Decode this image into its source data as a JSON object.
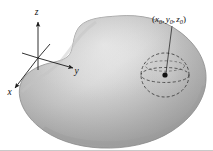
{
  "figure": {
    "caption_text": "",
    "background_color": "#ffffff",
    "axes": {
      "name": "coordinate-axes",
      "origin": {
        "x": 38,
        "y": 58
      },
      "labels": [
        {
          "id": "z",
          "text": "z",
          "x": 36.5,
          "y": 14.5,
          "axis": "z-axis",
          "direction": "up"
        },
        {
          "id": "y",
          "text": "y",
          "x": 76.5,
          "y": 73.5,
          "axis": "y-axis",
          "direction": "right"
        },
        {
          "id": "x",
          "text": "x",
          "x": 9.5,
          "y": 94.5,
          "axis": "x-axis",
          "direction": "lower-left"
        }
      ]
    },
    "solid": {
      "name": "gray-blob-solid",
      "fill_light": "#e8e8e8",
      "fill_mid": "#b6b6b6",
      "fill_dark": "#8a8a8a",
      "outline_color": "#6f6f6f"
    },
    "sphere": {
      "name": "dashed-sphere",
      "center": {
        "x": 165,
        "y": 75
      },
      "radius_x": 24,
      "radius_y": 22,
      "equator_ry": 7.5,
      "stroke_color": "#3a3a3a",
      "dash_pattern": "3,2.2"
    },
    "point": {
      "name": "center-point",
      "x": 165,
      "y": 75,
      "radius": 2.6,
      "color": "#111111"
    },
    "point_label": {
      "open_paren": "(",
      "x_var": "x",
      "x_sub": "0",
      "comma_1": ",",
      "y_var": "y",
      "y_sub": "0",
      "comma_2": ",",
      "z_var": "z",
      "z_sub": "0",
      "close_paren": ")",
      "anchor": {
        "x": 153,
        "y": 22
      },
      "leader_from": {
        "x": 172,
        "y": 26
      },
      "leader_to": {
        "x": 166,
        "y": 73
      },
      "leader_color": "#2b2b2b"
    },
    "baseline_rule": {
      "name": "bottom-rule",
      "y": 150,
      "color": "#c9c9c9"
    }
  }
}
